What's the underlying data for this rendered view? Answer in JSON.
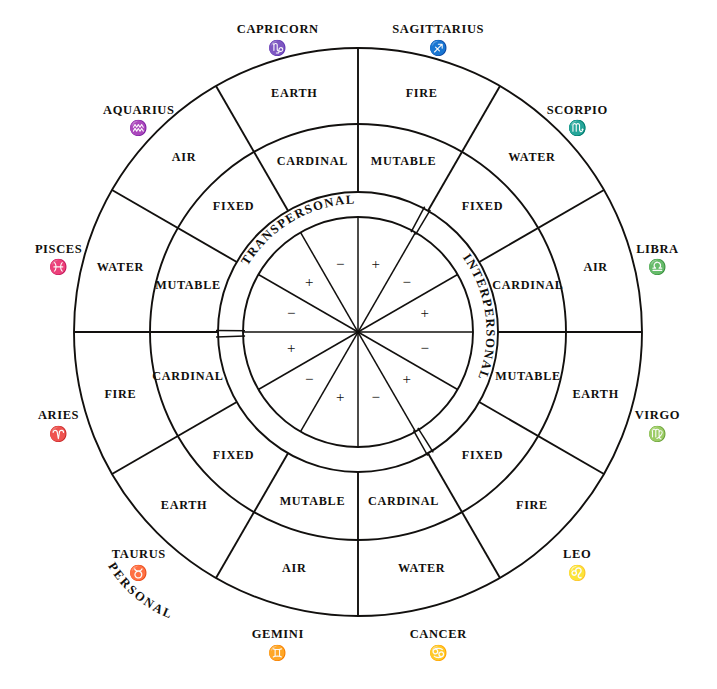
{
  "diagram": {
    "geometry": {
      "center_x": 358,
      "center_y": 332,
      "r_outer": 284,
      "r_element_inner": 208,
      "r_quality_inner": 140,
      "r_band_inner": 115,
      "sector_count": 12,
      "sector_degrees": 30
    },
    "colors": {
      "ink": "#12100e",
      "paper": "#ffffff"
    }
  },
  "signs": [
    {
      "name": "SAGITTARIUS",
      "glyph": "♐",
      "element": "FIRE",
      "quality": "MUTABLE",
      "polarity": "+",
      "band": "TRANSPERSONAL",
      "mid_angle_deg": 15
    },
    {
      "name": "CAPRICORN",
      "glyph": "♑",
      "element": "EARTH",
      "quality": "CARDINAL",
      "polarity": "−",
      "band": "TRANSPERSONAL",
      "mid_angle_deg": 345
    },
    {
      "name": "AQUARIUS",
      "glyph": "♒",
      "element": "AIR",
      "quality": "FIXED",
      "polarity": "+",
      "band": "TRANSPERSONAL",
      "mid_angle_deg": 315
    },
    {
      "name": "PISCES",
      "glyph": "♓",
      "element": "WATER",
      "quality": "MUTABLE",
      "polarity": "−",
      "band": "TRANSPERSONAL",
      "mid_angle_deg": 285
    },
    {
      "name": "ARIES",
      "glyph": "♈",
      "element": "FIRE",
      "quality": "CARDINAL",
      "polarity": "+",
      "band": "PERSONAL",
      "mid_angle_deg": 255
    },
    {
      "name": "TAURUS",
      "glyph": "♉",
      "element": "EARTH",
      "quality": "FIXED",
      "polarity": "−",
      "band": "PERSONAL",
      "mid_angle_deg": 225
    },
    {
      "name": "GEMINI",
      "glyph": "♊",
      "element": "AIR",
      "quality": "MUTABLE",
      "polarity": "+",
      "band": "PERSONAL",
      "mid_angle_deg": 195
    },
    {
      "name": "CANCER",
      "glyph": "♋",
      "element": "WATER",
      "quality": "CARDINAL",
      "polarity": "−",
      "band": "PERSONAL",
      "mid_angle_deg": 165
    },
    {
      "name": "LEO",
      "glyph": "♌",
      "element": "FIRE",
      "quality": "FIXED",
      "polarity": "+",
      "band": "INTERPERSONAL",
      "mid_angle_deg": 135
    },
    {
      "name": "VIRGO",
      "glyph": "♍",
      "element": "EARTH",
      "quality": "MUTABLE",
      "polarity": "−",
      "band": "INTERPERSONAL",
      "mid_angle_deg": 105
    },
    {
      "name": "LIBRA",
      "glyph": "♎",
      "element": "AIR",
      "quality": "CARDINAL",
      "polarity": "+",
      "band": "INTERPERSONAL",
      "mid_angle_deg": 75
    },
    {
      "name": "SCORPIO",
      "glyph": "♏",
      "element": "WATER",
      "quality": "FIXED",
      "polarity": "−",
      "band": "INTERPERSONAL",
      "mid_angle_deg": 45
    }
  ],
  "bands": [
    {
      "label": "TRANSPERSONAL",
      "start_deg": 270,
      "end_deg": 30
    },
    {
      "label": "INTERPERSONAL",
      "start_deg": 30,
      "end_deg": 150
    },
    {
      "label": "PERSONAL",
      "start_deg": 150,
      "end_deg": 270
    }
  ],
  "legend": {
    "elements": [
      "FIRE",
      "EARTH",
      "AIR",
      "WATER"
    ],
    "qualities": [
      "CARDINAL",
      "FIXED",
      "MUTABLE"
    ],
    "polarities": [
      "+",
      "−"
    ]
  }
}
